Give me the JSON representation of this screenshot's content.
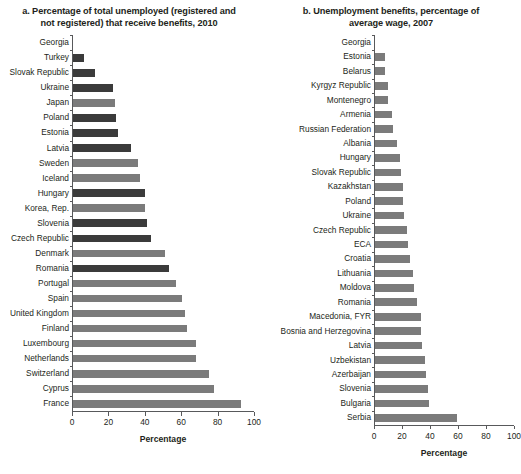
{
  "chart_data": [
    {
      "type": "bar",
      "orientation": "horizontal",
      "panel": "a",
      "title": "a. Percentage of total unemployed (registered and not registered) that receive benefits, 2010",
      "xlabel": "Percentage",
      "ylabel": "",
      "xlim": [
        0,
        100
      ],
      "xticks": [
        0,
        20,
        40,
        60,
        80,
        100
      ],
      "xticklabels": [
        "0",
        "20",
        "40",
        "60",
        "80",
        "100"
      ],
      "grid": false,
      "legend": false,
      "series_colors": {
        "eca": "#3b3b3b",
        "other": "#7b7b7b"
      },
      "categories": [
        "Georgia",
        "Turkey",
        "Slovak Republic",
        "Ukraine",
        "Japan",
        "Poland",
        "Estonia",
        "Latvia",
        "Sweden",
        "Iceland",
        "Hungary",
        "Korea, Rep.",
        "Slovenia",
        "Czech Republic",
        "Denmark",
        "Romania",
        "Portugal",
        "Spain",
        "United Kingdom",
        "Finland",
        "Luxembourg",
        "Netherlands",
        "Switzerland",
        "Cyprus",
        "France"
      ],
      "values": [
        0,
        6,
        12,
        22,
        23,
        24,
        25,
        32,
        36,
        37,
        40,
        40,
        41,
        43,
        51,
        53,
        57,
        60,
        62,
        63,
        68,
        68,
        75,
        78,
        93
      ],
      "group": [
        "eca",
        "eca",
        "eca",
        "eca",
        "other",
        "eca",
        "eca",
        "eca",
        "other",
        "other",
        "eca",
        "other",
        "eca",
        "eca",
        "other",
        "eca",
        "other",
        "other",
        "other",
        "other",
        "other",
        "other",
        "other",
        "other",
        "other"
      ]
    },
    {
      "type": "bar",
      "orientation": "horizontal",
      "panel": "b",
      "title": "b. Unemployment benefits, percentage of average wage, 2007",
      "xlabel": "Percentage",
      "ylabel": "",
      "xlim": [
        0,
        100
      ],
      "xticks": [
        0,
        20,
        40,
        60,
        80,
        100
      ],
      "xticklabels": [
        "0",
        "20",
        "40",
        "60",
        "80",
        "100"
      ],
      "grid": false,
      "legend": false,
      "series_colors": {
        "eca": "#7b7b7b",
        "other": "#7b7b7b"
      },
      "categories": [
        "Georgia",
        "Estonia",
        "Belarus",
        "Kyrgyz Republic",
        "Montenegro",
        "Armenia",
        "Russian Federation",
        "Albania",
        "Hungary",
        "Slovak Republic",
        "Kazakhstan",
        "Poland",
        "Ukraine",
        "Czech Republic",
        "ECA",
        "Croatia",
        "Lithuania",
        "Moldova",
        "Romania",
        "Macedonia, FYR",
        "Bosnia and Herzegovina",
        "Latvia",
        "Uzbekistan",
        "Azerbaijan",
        "Slovenia",
        "Bulgaria",
        "Serbia"
      ],
      "values": [
        0,
        7,
        7,
        9,
        9,
        12,
        13,
        16,
        18,
        19,
        20,
        20,
        21,
        23,
        24,
        25,
        27,
        28,
        30,
        33,
        33,
        34,
        36,
        37,
        38,
        39,
        59
      ],
      "group": [
        "eca",
        "eca",
        "eca",
        "eca",
        "eca",
        "eca",
        "eca",
        "eca",
        "eca",
        "eca",
        "eca",
        "eca",
        "eca",
        "eca",
        "eca",
        "eca",
        "eca",
        "eca",
        "eca",
        "eca",
        "eca",
        "eca",
        "eca",
        "eca",
        "eca",
        "eca",
        "eca"
      ]
    }
  ]
}
